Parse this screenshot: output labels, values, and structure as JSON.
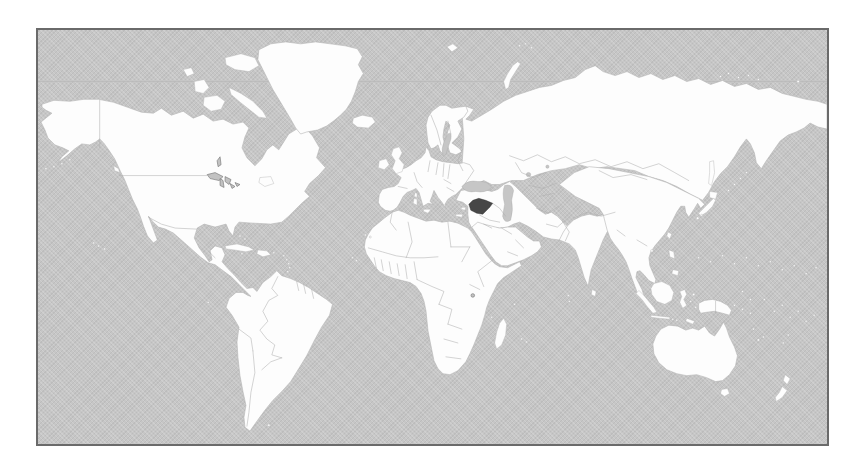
{
  "map": {
    "description": "World political map (gray ocean, white countries) with one country shaded dark",
    "highlighted_country": "Syria",
    "regions_depicted": [
      "North America",
      "Greenland",
      "South America",
      "Europe",
      "Africa",
      "Middle East",
      "Russia / Asia",
      "India",
      "Southeast Asia",
      "Indonesia",
      "Australia",
      "New Zealand",
      "Madagascar",
      "Japan",
      "Caribbean islands",
      "Pacific islands"
    ],
    "gridline": "single faint horizontal graticule line near the top (Arctic Circle)"
  },
  "colors": {
    "page_background": "#ffffff",
    "ocean": "#c6c6c6",
    "land": "#fdfdfd",
    "coastline": "#b4b4b4",
    "country_borders": "#ababab",
    "highlight": "#474747",
    "frame_border": "#6a6a6a",
    "lake_fill": "#c2c2c2",
    "lake_outline": "#6f6f6f",
    "graticule": "#b9b9b9"
  }
}
